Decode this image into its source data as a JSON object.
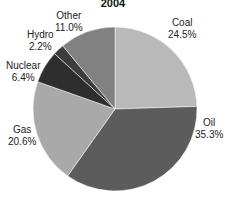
{
  "chart_data": {
    "type": "pie",
    "title": "2004",
    "slices": [
      {
        "label": "Coal",
        "value": 24.5,
        "display": "24.5%",
        "color": "#b9b9b9"
      },
      {
        "label": "Oil",
        "value": 35.3,
        "display": "35.3%",
        "color": "#5c5c5c"
      },
      {
        "label": "Gas",
        "value": 20.6,
        "display": "20.6%",
        "color": "#a9a9a9"
      },
      {
        "label": "Nuclear",
        "value": 6.4,
        "display": "6.4%",
        "color": "#2e2e2e"
      },
      {
        "label": "Hydro",
        "value": 2.2,
        "display": "2.2%",
        "color": "#3c3c3c"
      },
      {
        "label": "Other",
        "value": 11.0,
        "display": "11.0%",
        "color": "#818181"
      }
    ],
    "start_angle_deg": 0,
    "direction": "clockwise"
  }
}
